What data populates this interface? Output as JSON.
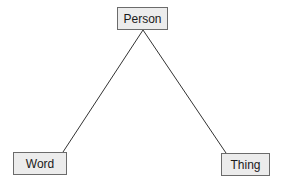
{
  "diagram": {
    "type": "triangle-concept-map",
    "nodes": [
      {
        "id": "person",
        "label": "Person",
        "x": 117,
        "y": 7,
        "w": 51,
        "h": 23
      },
      {
        "id": "word",
        "label": "Word",
        "x": 13,
        "y": 152,
        "w": 54,
        "h": 23
      },
      {
        "id": "thing",
        "label": "Thing",
        "x": 221,
        "y": 153,
        "w": 49,
        "h": 23
      }
    ],
    "edges": [
      {
        "from": "person",
        "to": "word"
      },
      {
        "from": "person",
        "to": "thing"
      }
    ],
    "colors": {
      "node_fill": "#ececec",
      "node_border": "#6b6b6b",
      "edge": "#333333",
      "background": "#ffffff"
    }
  }
}
